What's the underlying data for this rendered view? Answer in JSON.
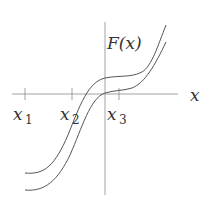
{
  "diagram": {
    "function_label": "F(x)",
    "axis_label_x": "x",
    "ticks": [
      {
        "name": "x",
        "sub": "1"
      },
      {
        "name": "x",
        "sub": "2"
      },
      {
        "name": "x",
        "sub": "3"
      }
    ],
    "curves": [
      {
        "name": "upper-curve",
        "description": "cubic-like increasing curve, shifted up"
      },
      {
        "name": "lower-curve",
        "description": "cubic-like increasing curve, passes through origin"
      }
    ],
    "colors": {
      "axis": "#8a8a8a",
      "curve": "#555555",
      "text": "#333333"
    }
  }
}
